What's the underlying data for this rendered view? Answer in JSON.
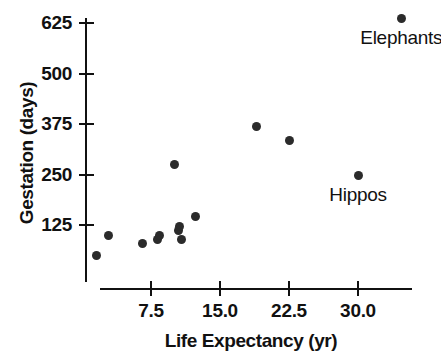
{
  "chart_data": {
    "type": "scatter",
    "title": "",
    "xlabel": "Life Expectancy (yr)",
    "ylabel": "Gestation (days)",
    "xlim": [
      0,
      37
    ],
    "ylim": [
      0,
      660
    ],
    "xticks": [
      7.5,
      15.0,
      22.5,
      30.0
    ],
    "xtick_labels": [
      "7.5",
      "15.0",
      "22.5",
      "30.0"
    ],
    "yticks": [
      125,
      250,
      375,
      500,
      625
    ],
    "ytick_labels": [
      "125",
      "250",
      "375",
      "500",
      "625"
    ],
    "grid": false,
    "legend": null,
    "points": [
      {
        "x": 1.6,
        "y": 50,
        "label": null
      },
      {
        "x": 2.9,
        "y": 100,
        "label": null
      },
      {
        "x": 6.6,
        "y": 80,
        "label": null
      },
      {
        "x": 8.2,
        "y": 90,
        "label": null
      },
      {
        "x": 8.4,
        "y": 100,
        "label": null
      },
      {
        "x": 10.5,
        "y": 112,
        "label": null
      },
      {
        "x": 10.6,
        "y": 122,
        "label": null
      },
      {
        "x": 10.8,
        "y": 90,
        "label": null
      },
      {
        "x": 12.3,
        "y": 145,
        "label": null
      },
      {
        "x": 10.0,
        "y": 275,
        "label": null
      },
      {
        "x": 19.0,
        "y": 370,
        "label": null
      },
      {
        "x": 22.5,
        "y": 333,
        "label": null
      },
      {
        "x": 30.0,
        "y": 247,
        "label": "Hippos"
      },
      {
        "x": 34.7,
        "y": 635,
        "label": "Elephants"
      }
    ],
    "annotations": [
      {
        "text": "Elephants",
        "near_point_x": 34.7,
        "near_point_y": 635
      },
      {
        "text": "Hippos",
        "near_point_x": 30.0,
        "near_point_y": 247
      }
    ],
    "colors": {
      "marker": "#2b2b2b",
      "axis": "#111111",
      "background": "#ffffff"
    }
  }
}
